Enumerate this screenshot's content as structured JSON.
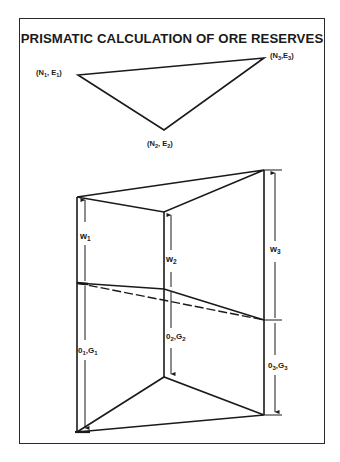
{
  "title": "PRISMATIC CALCULATION OF ORE RESERVES",
  "plan_view": {
    "points": [
      {
        "id": "p1",
        "label_main": "(N",
        "sub1": "1",
        "mid": ", E",
        "sub2": "1",
        "end": ")",
        "x": 78,
        "y": 75
      },
      {
        "id": "p2",
        "label_main": "(N",
        "sub1": "2",
        "mid": ", E",
        "sub2": "2",
        "end": ")",
        "x": 164,
        "y": 130
      },
      {
        "id": "p3",
        "label_main": "(N",
        "sub1": "3",
        "mid": ",E",
        "sub2": "3",
        "end": ")",
        "x": 264,
        "y": 58
      }
    ]
  },
  "prism": {
    "columns": [
      {
        "id": "1",
        "waste_label": "w",
        "waste_sub": "1",
        "ore_label": "0",
        "ore_sub": "1",
        "ore_label2": ",G",
        "ore_sub2": "1"
      },
      {
        "id": "2",
        "waste_label": "w",
        "waste_sub": "2",
        "ore_label": "0",
        "ore_sub": "2",
        "ore_label2": ",G",
        "ore_sub2": "2"
      },
      {
        "id": "3",
        "waste_label": "w",
        "waste_sub": "3",
        "ore_label": "0",
        "ore_sub": "3",
        "ore_label2": ",G",
        "ore_sub2": "3"
      }
    ]
  },
  "colors": {
    "line": "#1a1a1a",
    "background": "#ffffff"
  }
}
